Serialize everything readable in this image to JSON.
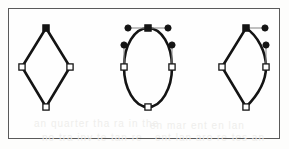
{
  "figure": {
    "frame": {
      "x": 8,
      "y": 8,
      "width": 272,
      "height": 131,
      "border_color": "#5a5a5a",
      "border_width": 1.5,
      "background_color": "#fefefe"
    },
    "canvas_background": "#fdfdfc",
    "stroke_color": "#141414",
    "anchor_fill_selected": "#141414",
    "anchor_fill_unselected": "#ffffff",
    "handle_fill": "#141414",
    "handle_line_color": "#8d8d8d",
    "path_stroke_width": 2.6,
    "shapes": [
      {
        "id": "shape-diamond-corner",
        "label": "diamond with corner anchor points",
        "type": "polygon",
        "path": "M 46 28 L 70 67 L 46 107 L 22 67 Z",
        "anchors": [
          {
            "name": "anchor-top",
            "x": 46,
            "y": 28,
            "selected": true,
            "shape": "square"
          },
          {
            "name": "anchor-right",
            "x": 70,
            "y": 67,
            "selected": false,
            "shape": "square"
          },
          {
            "name": "anchor-bottom",
            "x": 46,
            "y": 107,
            "selected": false,
            "shape": "square"
          },
          {
            "name": "anchor-left",
            "x": 22,
            "y": 67,
            "selected": false,
            "shape": "square"
          }
        ],
        "handles": []
      },
      {
        "id": "shape-ellipse-smooth",
        "label": "ellipse with smooth curve anchor points",
        "type": "bezier",
        "path": "M 148 28 C 161.5 28 172 45.5 172 67 C 172 88.5 161.5 107 148 107 C 134.5 107 124 88.5 124 67 C 124 45.5 134.5 28 148 28 Z",
        "anchors": [
          {
            "name": "anchor-top",
            "x": 148,
            "y": 28,
            "selected": true,
            "shape": "square"
          },
          {
            "name": "anchor-right",
            "x": 172,
            "y": 67,
            "selected": false,
            "shape": "square"
          },
          {
            "name": "anchor-bottom",
            "x": 148,
            "y": 107,
            "selected": false,
            "shape": "square"
          },
          {
            "name": "anchor-left",
            "x": 124,
            "y": 67,
            "selected": false,
            "shape": "square"
          }
        ],
        "handles": [
          {
            "name": "handle-top-left",
            "anchor_x": 148,
            "anchor_y": 28,
            "x": 128,
            "y": 28
          },
          {
            "name": "handle-top-right",
            "anchor_x": 148,
            "anchor_y": 28,
            "x": 168,
            "y": 28
          },
          {
            "name": "handle-left-up",
            "anchor_x": 124,
            "anchor_y": 67,
            "x": 124,
            "y": 45
          },
          {
            "name": "handle-right-up",
            "anchor_x": 172,
            "anchor_y": 67,
            "x": 172,
            "y": 45
          }
        ]
      },
      {
        "id": "shape-diamond-mixed",
        "label": "diamond with one corner and one smooth side",
        "type": "bezier",
        "path": "M 246 28 C 258 36 266 52 266 67 C 266 84 256 97 246 107 L 222 67 Z",
        "anchors": [
          {
            "name": "anchor-top",
            "x": 246,
            "y": 28,
            "selected": true,
            "shape": "square"
          },
          {
            "name": "anchor-right",
            "x": 266,
            "y": 67,
            "selected": false,
            "shape": "square"
          },
          {
            "name": "anchor-bottom",
            "x": 246,
            "y": 107,
            "selected": false,
            "shape": "square"
          },
          {
            "name": "anchor-left",
            "x": 222,
            "y": 67,
            "selected": false,
            "shape": "square"
          }
        ],
        "handles": [
          {
            "name": "handle-top-right",
            "anchor_x": 246,
            "anchor_y": 28,
            "x": 265,
            "y": 28
          },
          {
            "name": "handle-right-up",
            "anchor_x": 266,
            "anchor_y": 67,
            "x": 266,
            "y": 45
          }
        ]
      }
    ],
    "bleed_through": [
      {
        "text": "an quarter tha ra in the",
        "x": 34,
        "y": 118,
        "size": 10
      },
      {
        "text": "en mar ent en lan",
        "x": 150,
        "y": 120,
        "size": 10
      },
      {
        "text": "no tra inv te tan re",
        "x": 42,
        "y": 132,
        "size": 10
      },
      {
        "text": "ent lan aro re tes an",
        "x": 155,
        "y": 132,
        "size": 10
      }
    ]
  }
}
